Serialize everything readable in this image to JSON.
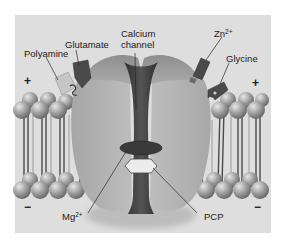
{
  "figure": {
    "style": "grayscale illustration",
    "colors": {
      "page_background": "#ffffff",
      "panel_background": "#dcdcdc",
      "receptor_body": "#b4b4b4",
      "channel_pore": "#3e3e3e",
      "ligand_dark": "#4a4a4a",
      "ligand_light": "#c8c8c8",
      "lipid_head": "#9a9a9a",
      "label_text": "#1a1a1a"
    }
  },
  "labels": {
    "polyamine": "Polyamine",
    "glutamate": "Glutamate",
    "calcium_line1": "Calcium",
    "calcium_line2": "channel",
    "zinc_base": "Zn",
    "zinc_charge": "2+",
    "glycine": "Glycine",
    "magnesium_base": "Mg",
    "magnesium_charge": "2+",
    "pcp": "PCP"
  },
  "signs": {
    "outside_left": "+",
    "outside_right": "+",
    "inside_left": "−",
    "inside_right": "−"
  }
}
